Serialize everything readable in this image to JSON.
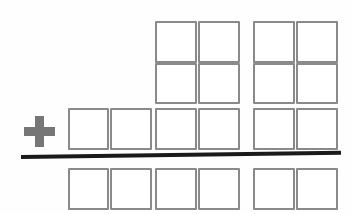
{
  "worksheet": {
    "title": "Addition box worksheet",
    "description": "Blank vertical addition frame with empty digit boxes",
    "background_color": "#fefefe",
    "box_border_color": "#8a8a8a",
    "operator_color": "#767676",
    "rule_color": "#1a1a1a",
    "box_size": 42,
    "column_count": 6,
    "row_count": 4
  },
  "operator": {
    "symbol": "+",
    "name": "plus-sign",
    "x": 24,
    "y": 116,
    "size": 31
  },
  "rule": {
    "name": "sum-rule",
    "x": 21,
    "y": 155,
    "width": 320,
    "thickness": 4,
    "tilt_degrees": -0.75
  },
  "columns_x": [
    68,
    110,
    155,
    198,
    253,
    296
  ],
  "rows": [
    {
      "id": "addend-row-1",
      "label": "First addend",
      "y": 21,
      "height": 42,
      "boxes": [
        {
          "label": "",
          "value": "",
          "col": 2,
          "x": 155,
          "width": 42
        },
        {
          "label": "",
          "value": "",
          "col": 3,
          "x": 198,
          "width": 42
        },
        {
          "label": "",
          "value": "",
          "col": 4,
          "x": 253,
          "width": 42
        },
        {
          "label": "",
          "value": "",
          "col": 5,
          "x": 296,
          "width": 42
        }
      ]
    },
    {
      "id": "addend-row-2",
      "label": "Second addend",
      "y": 63,
      "height": 41,
      "boxes": [
        {
          "label": "",
          "value": "",
          "col": 2,
          "x": 155,
          "width": 42
        },
        {
          "label": "",
          "value": "",
          "col": 3,
          "x": 198,
          "width": 42
        },
        {
          "label": "",
          "value": "",
          "col": 4,
          "x": 253,
          "width": 42
        },
        {
          "label": "",
          "value": "",
          "col": 5,
          "x": 296,
          "width": 42
        }
      ]
    },
    {
      "id": "addend-row-3",
      "label": "Third addend",
      "y": 108,
      "height": 42,
      "boxes": [
        {
          "label": "",
          "value": "",
          "col": 0,
          "x": 68,
          "width": 41
        },
        {
          "label": "",
          "value": "",
          "col": 1,
          "x": 110,
          "width": 42
        },
        {
          "label": "",
          "value": "",
          "col": 2,
          "x": 155,
          "width": 42
        },
        {
          "label": "",
          "value": "",
          "col": 3,
          "x": 198,
          "width": 42
        },
        {
          "label": "",
          "value": "",
          "col": 4,
          "x": 253,
          "width": 42
        },
        {
          "label": "",
          "value": "",
          "col": 5,
          "x": 296,
          "width": 42
        }
      ]
    },
    {
      "id": "sum-row",
      "label": "Sum",
      "y": 168,
      "height": 42,
      "boxes": [
        {
          "label": "",
          "value": "",
          "col": 0,
          "x": 68,
          "width": 41
        },
        {
          "label": "",
          "value": "",
          "col": 1,
          "x": 110,
          "width": 42
        },
        {
          "label": "",
          "value": "",
          "col": 2,
          "x": 155,
          "width": 42
        },
        {
          "label": "",
          "value": "",
          "col": 3,
          "x": 198,
          "width": 42
        },
        {
          "label": "",
          "value": "",
          "col": 4,
          "x": 253,
          "width": 42
        },
        {
          "label": "",
          "value": "",
          "col": 5,
          "x": 296,
          "width": 42
        }
      ]
    }
  ]
}
